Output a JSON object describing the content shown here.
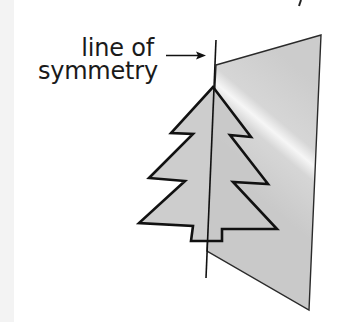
{
  "diagram": {
    "label": {
      "line1": "line of",
      "line2": "symmetry"
    },
    "elements": {
      "mirror_panel": {
        "shape": "quadrilateral",
        "fill": "#cfcfcf",
        "stroke": "#222222"
      },
      "tree": {
        "shape": "fir-tree",
        "tiers": 3,
        "fill": "#c9c9c9",
        "stroke": "#111111"
      },
      "symmetry_line": {
        "orientation": "vertical",
        "stroke": "#111111"
      },
      "arrow": {
        "direction": "right",
        "points_to": "symmetry_line"
      }
    },
    "colors": {
      "panel": "#cfcfcf",
      "tree": "#c8c8c8",
      "outline": "#111111",
      "text": "#1a1a1a",
      "background": "#ffffff"
    }
  }
}
